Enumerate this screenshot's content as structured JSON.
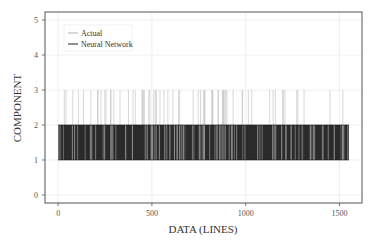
{
  "chart_data": {
    "type": "line",
    "title": "",
    "xlabel": "DATA (LINES)",
    "ylabel": "COMPONENT",
    "xlim": [
      -70,
      1620
    ],
    "ylim": [
      -0.23,
      5.23
    ],
    "xticks": [
      0,
      500,
      1000,
      1500
    ],
    "yticks": [
      0,
      1,
      2,
      3,
      4,
      5
    ],
    "grid": true,
    "legend_position": "upper left",
    "series": [
      {
        "name": "Actual",
        "color": "#b0b0b0",
        "description": "Step signal spanning x≈0–1550; values alternate mostly between 1 and 2 with frequent spikes up to 3",
        "value_levels": [
          1,
          2,
          3
        ],
        "x_range": [
          0,
          1550
        ]
      },
      {
        "name": "Neural Network",
        "color": "#222222",
        "description": "Step signal spanning x≈0–1550; values rapidly alternate between 1 and 2, producing a dense dark band",
        "value_levels": [
          1,
          2
        ],
        "x_range": [
          0,
          1550
        ]
      }
    ]
  },
  "legend": {
    "items": [
      {
        "label": "Actual",
        "color": "#b0b0b0"
      },
      {
        "label": "Neural Network",
        "color": "#222222"
      }
    ]
  },
  "axes": {
    "xlabel": "DATA (LINES)",
    "ylabel": "COMPONENT",
    "xtick_labels": [
      "0",
      "500",
      "1000",
      "1500"
    ],
    "ytick_labels": [
      "0",
      "1",
      "2",
      "3",
      "4",
      "5"
    ]
  }
}
